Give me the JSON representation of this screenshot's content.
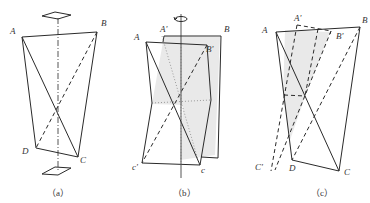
{
  "figure": {
    "panels": [
      {
        "id": "a",
        "caption": "（a）",
        "labels": {
          "A": "A",
          "B": "B",
          "C": "C",
          "D": "D"
        },
        "description": "Tetrahedron ABCD with vertical dash-dot symmetry axis and square symbols above and below"
      },
      {
        "id": "b",
        "caption": "（b）",
        "labels": {
          "A": "A",
          "A_prime": "A'",
          "B": "B",
          "B_prime": "B'",
          "c": "c",
          "c_prime": "c'"
        },
        "description": "Tetrahedron rotated about vertical axis, shaded rotated plane, rotation arrow on top"
      },
      {
        "id": "c",
        "caption": "（c）",
        "labels": {
          "A": "A",
          "A_prime": "A'",
          "B": "B",
          "B_prime": "B'",
          "C": "C",
          "C_prime": "C'",
          "D": "D"
        },
        "description": "Tetrahedron ABCD with dashed transformed copy A'B'C'"
      }
    ],
    "colors": {
      "line": "#2a2a2a",
      "text": "#333333",
      "shade": "#e9e9e9"
    }
  }
}
